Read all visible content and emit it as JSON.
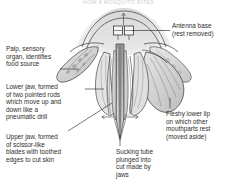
{
  "figure": {
    "title": "HOW A MOSQUITO BITES",
    "style": "grayscale pen-and-ink line drawing",
    "background_color": "#ffffff",
    "ink_color": "#2e2e2e",
    "shade_color": "#b9b9b9"
  },
  "labels": {
    "antenna": {
      "text": "Antenna base\n(rest removed)",
      "position": "top-right",
      "leader": "horizontal line left to antenna sockets"
    },
    "palp": {
      "text": "Palp, sensory\norgan, identifies\nfood source",
      "position": "upper-left",
      "leader": "horizontal dash right to palp"
    },
    "lower_jaw": {
      "text": "Lower jaw, formed\nof two pointed rods\nwhich move up and\ndown like a\npneumatic drill",
      "position": "middle-left",
      "leader": "horizontal dash right to stylets"
    },
    "upper_jaw": {
      "text": "Upper jaw, formed\nof scissor-like\nblades with toothed\nedges to cut skin",
      "position": "lower-left",
      "leader": "diagonal line up-right to blades"
    },
    "lower_lip": {
      "text": "Fleshy lower lip\non which other\nmouthparts rest\n(moved aside)",
      "position": "right",
      "leader": "short vertical tick up to labium"
    },
    "sucking_tube": {
      "text": "Sucking tube\nplunged into\ncut made by\njaws",
      "position": "bottom-center",
      "leader": "vertical line up to proboscis tip"
    }
  },
  "annotations": {
    "arrow_left": "arrow pointing left (outward motion)",
    "arrow_right": "arrow pointing right (outward motion)"
  }
}
